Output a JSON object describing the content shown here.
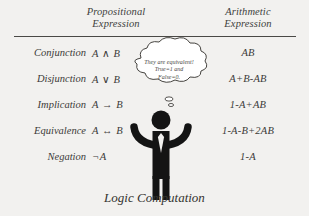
{
  "figure": {
    "caption": "Logic Computation",
    "background_color": "#f2f1ef",
    "text_color": "#3b3a38"
  },
  "table": {
    "headers": {
      "row_label": "",
      "propositional": {
        "line1": "Propositional",
        "line2": "Expression"
      },
      "arithmetic": {
        "line1": "Arithmetic",
        "line2": "Expression"
      }
    },
    "rows": [
      {
        "name": "Conjunction",
        "propositional": "A ∧ B",
        "arithmetic": "AB"
      },
      {
        "name": "Disjunction",
        "propositional": "A ∨ B",
        "arithmetic": "A+B-AB"
      },
      {
        "name": "Implication",
        "propositional": "A → B",
        "arithmetic": "1-A+AB"
      },
      {
        "name": "Equivalence",
        "propositional": "A ↔ B",
        "arithmetic": "1-A-B+2AB"
      },
      {
        "name": "Negation",
        "propositional": "¬A",
        "arithmetic": "1-A"
      }
    ]
  },
  "thought_bubble": {
    "line1": "They are equivalent!",
    "line2": "True=1 and",
    "line3": "False=0."
  },
  "character": {
    "description": "stick figure with raised arms and necktie",
    "color": "#141414",
    "tie_color": "#f2f1ef"
  }
}
